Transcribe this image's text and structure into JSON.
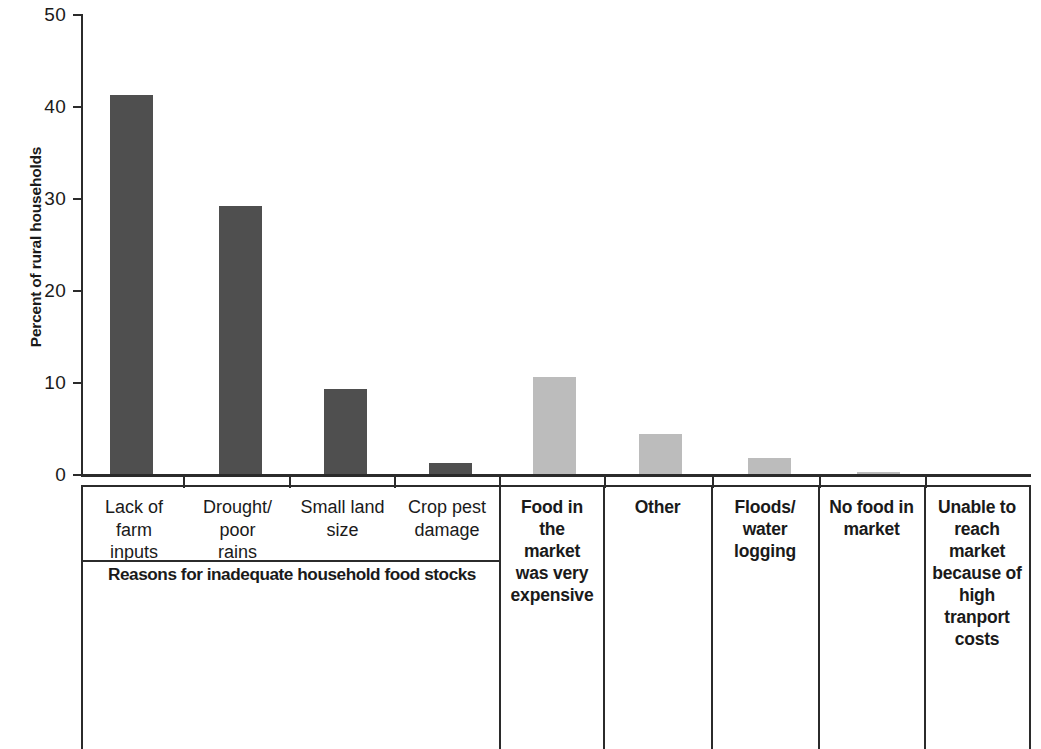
{
  "chart_data": {
    "type": "bar",
    "title": "",
    "xlabel": "",
    "ylabel": "Percent of rural households",
    "ylim": [
      0,
      50
    ],
    "yticks": [
      0,
      10,
      20,
      30,
      40,
      50
    ],
    "grid": false,
    "legend": "none",
    "categories": [
      "Lack of farm inputs",
      "Drought/ poor rains",
      "Small land size",
      "Crop pest damage",
      "Food in the market was very expensive",
      "Other",
      "Floods/ water logging",
      "No food in market",
      "Unable to reach market because of high tranport costs"
    ],
    "values": [
      41.3,
      29.2,
      9.3,
      1.3,
      10.6,
      4.5,
      1.9,
      0.3,
      0.0
    ],
    "group_label": "Reasons for inadequate household food stocks",
    "colors": {
      "group1_bar": "#4f4f4f",
      "group2_bar": "#bcbcbc",
      "axis": "#2b2b2b",
      "text": "#1a1a1a"
    }
  },
  "axis": {
    "y_title": "Percent of rural households",
    "y_labels": [
      "50",
      "40",
      "30",
      "20",
      "10",
      "0"
    ]
  },
  "categories": [
    {
      "lines": [
        "Lack of",
        "farm",
        "inputs"
      ],
      "style": "plain"
    },
    {
      "lines": [
        "Drought/",
        "poor",
        "rains"
      ],
      "style": "plain"
    },
    {
      "lines": [
        "Small land",
        "size"
      ],
      "style": "plain"
    },
    {
      "lines": [
        "Crop pest",
        "damage"
      ],
      "style": "plain"
    },
    {
      "lines": [
        "Food in",
        "the",
        "market",
        "was very",
        "expensive"
      ],
      "style": "bold"
    },
    {
      "lines": [
        "Other"
      ],
      "style": "bold"
    },
    {
      "lines": [
        "Floods/",
        "water",
        "logging"
      ],
      "style": "bold"
    },
    {
      "lines": [
        "No food in",
        "market"
      ],
      "style": "bold"
    },
    {
      "lines": [
        "Unable to",
        "reach",
        "market",
        "because of",
        "high",
        "tranport",
        "costs"
      ],
      "style": "bold"
    }
  ],
  "group_label": "Reasons for inadequate household food stocks"
}
